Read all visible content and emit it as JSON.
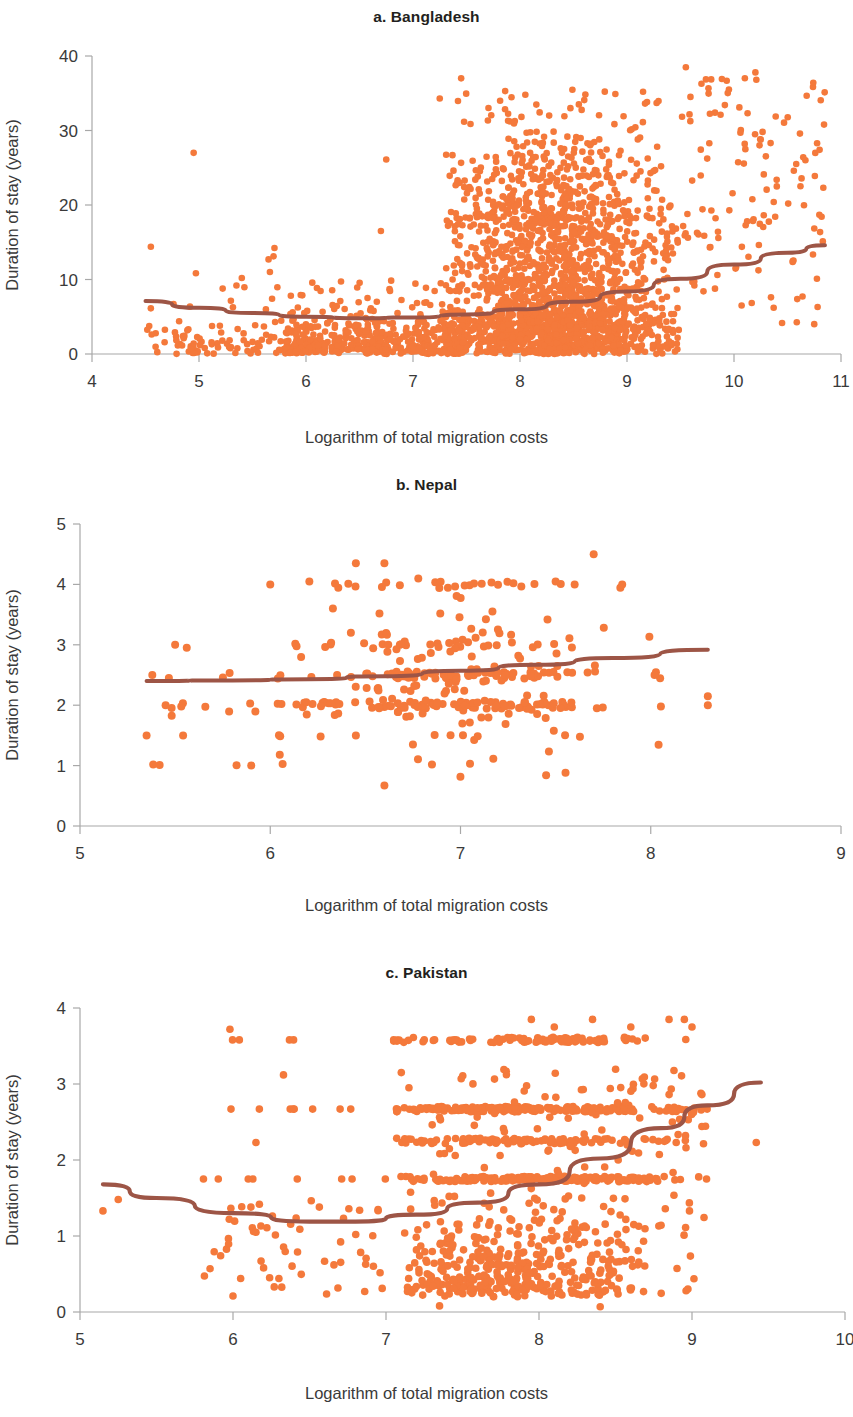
{
  "figure": {
    "shared_xlabel": "Logarithm of total migration costs",
    "shared_ylabel": "Duration of stay (years)",
    "point_color": "#F4793B",
    "trend_color": "#9D5546",
    "axis_color": "#a8a8a8",
    "text_color": "#3a3a3a"
  },
  "panels": [
    {
      "key": "bangladesh",
      "title": "a. Bangladesh",
      "xlabel": "Logarithm of total migration costs",
      "ylabel": "Duration of stay (years)"
    },
    {
      "key": "nepal",
      "title": "b. Nepal",
      "xlabel": "Logarithm of total migration costs",
      "ylabel": "Duration of stay (years)"
    },
    {
      "key": "pakistan",
      "title": "c. Pakistan",
      "xlabel": "Logarithm of total migration costs",
      "ylabel": "Duration of stay (years)"
    }
  ],
  "chart_data": [
    {
      "type": "scatter",
      "panel": "a",
      "title": "a. Bangladesh",
      "xlabel": "Logarithm of total migration costs",
      "ylabel": "Duration of stay (years)",
      "xlim": [
        4,
        11
      ],
      "ylim": [
        0,
        40
      ],
      "xticks": [
        4,
        5,
        6,
        7,
        8,
        9,
        10,
        11
      ],
      "yticks": [
        0,
        10,
        20,
        30,
        40
      ],
      "grid": false,
      "legend": "none",
      "n_points": 2600,
      "x_data_range": [
        4.5,
        10.85
      ],
      "y_data_range": [
        0,
        38.5
      ],
      "x_density_peak": 8.4,
      "x_density_sigma": 0.62,
      "y_median_at_peak": 7.5,
      "cluster_note": "dense mass between x=7.4 and x=9.5, y from 0 to 35",
      "trend": {
        "name": "fitted quadratic trend",
        "color": "#9D5546",
        "shape": "u-shaped, minimum near x=6.4",
        "points": [
          {
            "x": 4.5,
            "y": 7.1
          },
          {
            "x": 5.0,
            "y": 6.2
          },
          {
            "x": 5.5,
            "y": 5.5
          },
          {
            "x": 6.0,
            "y": 5.0
          },
          {
            "x": 6.5,
            "y": 4.8
          },
          {
            "x": 7.0,
            "y": 4.9
          },
          {
            "x": 7.5,
            "y": 5.3
          },
          {
            "x": 8.0,
            "y": 6.0
          },
          {
            "x": 8.5,
            "y": 7.0
          },
          {
            "x": 9.0,
            "y": 8.4
          },
          {
            "x": 9.5,
            "y": 10.1
          },
          {
            "x": 10.0,
            "y": 12.0
          },
          {
            "x": 10.5,
            "y": 13.6
          },
          {
            "x": 10.85,
            "y": 14.6
          }
        ]
      }
    },
    {
      "type": "scatter",
      "panel": "b",
      "title": "b. Nepal",
      "xlabel": "Logarithm of total migration costs",
      "ylabel": "Duration of stay (years)",
      "xlim": [
        5,
        9
      ],
      "ylim": [
        0,
        5
      ],
      "xticks": [
        5,
        6,
        7,
        8,
        9
      ],
      "yticks": [
        0,
        1,
        2,
        3,
        4,
        5
      ],
      "grid": false,
      "legend": "none",
      "n_points": 330,
      "x_data_range": [
        5.35,
        8.3
      ],
      "y_data_range": [
        0.65,
        5.02
      ],
      "x_density_peak": 7.0,
      "x_density_sigma": 0.38,
      "y_bands": [
        2.0,
        2.5,
        3.0,
        4.0
      ],
      "cluster_note": "banding at y=2, 2.5, 3 and 4; densest near x=7.0, y=2.0-2.6",
      "trend": {
        "name": "fitted trend",
        "color": "#9D5546",
        "shape": "nearly flat, slight upward slope",
        "points": [
          {
            "x": 5.35,
            "y": 2.4
          },
          {
            "x": 5.8,
            "y": 2.41
          },
          {
            "x": 6.2,
            "y": 2.43
          },
          {
            "x": 6.6,
            "y": 2.48
          },
          {
            "x": 7.0,
            "y": 2.57
          },
          {
            "x": 7.4,
            "y": 2.67
          },
          {
            "x": 7.8,
            "y": 2.78
          },
          {
            "x": 8.3,
            "y": 2.92
          }
        ]
      }
    },
    {
      "type": "scatter",
      "panel": "c",
      "title": "c. Pakistan",
      "xlabel": "Logarithm of total migration costs",
      "ylabel": "Duration of stay (years)",
      "xlim": [
        5,
        10
      ],
      "ylim": [
        0,
        4
      ],
      "xticks": [
        5,
        6,
        7,
        8,
        9,
        10
      ],
      "yticks": [
        0,
        1,
        2,
        3,
        4
      ],
      "grid": false,
      "legend": "none",
      "n_points": 1050,
      "x_data_range": [
        5.15,
        9.45
      ],
      "y_data_range": [
        0.08,
        3.88
      ],
      "x_density_peak": 7.95,
      "x_density_sigma": 0.5,
      "y_bands": [
        3.58,
        2.67,
        2.25,
        1.75,
        0.83
      ],
      "cluster_note": "strong horizontal banding at y=3.58, 2.67, 2.25 and 1.75; dense low cloud 0.2-1.1 between x=7.3 and 8.6",
      "trend": {
        "name": "fitted quadratic trend",
        "color": "#9D5546",
        "shape": "u-shaped, minimum near x=6.6",
        "points": [
          {
            "x": 5.15,
            "y": 1.68
          },
          {
            "x": 5.5,
            "y": 1.5
          },
          {
            "x": 6.0,
            "y": 1.3
          },
          {
            "x": 6.5,
            "y": 1.19
          },
          {
            "x": 6.8,
            "y": 1.19
          },
          {
            "x": 7.2,
            "y": 1.28
          },
          {
            "x": 7.6,
            "y": 1.44
          },
          {
            "x": 8.0,
            "y": 1.68
          },
          {
            "x": 8.4,
            "y": 2.02
          },
          {
            "x": 8.8,
            "y": 2.42
          },
          {
            "x": 9.1,
            "y": 2.72
          },
          {
            "x": 9.45,
            "y": 3.02
          }
        ]
      }
    }
  ]
}
